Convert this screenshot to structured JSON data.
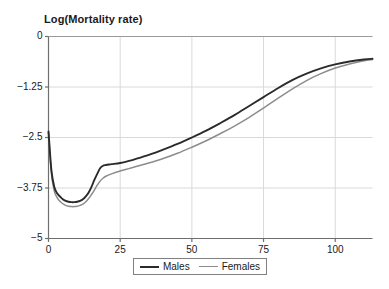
{
  "chart_data": {
    "type": "line",
    "title": "Log(Mortality rate)",
    "xlabel": "",
    "ylabel": "Log(Mortality rate)",
    "xlim": [
      0,
      113
    ],
    "ylim": [
      -5,
      0
    ],
    "grid": true,
    "legend_position": "bottom-center",
    "xticks": [
      0,
      25,
      50,
      75,
      100
    ],
    "xtick_labels": [
      "0",
      "25",
      "50",
      "75",
      "100"
    ],
    "yticks": [
      0,
      -1.25,
      -2.5,
      -3.75,
      -5
    ],
    "ytick_labels": [
      "0",
      "−1.25",
      "−2.5",
      "−3.75",
      "−5"
    ],
    "x": [
      0,
      1,
      2,
      3,
      4,
      5,
      6,
      7,
      8,
      9,
      10,
      11,
      12,
      13,
      14,
      15,
      16,
      17,
      18,
      19,
      20,
      22,
      25,
      28,
      30,
      35,
      40,
      45,
      50,
      55,
      60,
      65,
      70,
      75,
      80,
      85,
      90,
      95,
      100,
      105,
      110,
      113
    ],
    "series": [
      {
        "name": "Males",
        "color": "#2b2b2b",
        "line_width": 1.9,
        "values": [
          -2.35,
          -3.3,
          -3.72,
          -3.88,
          -3.96,
          -4.03,
          -4.07,
          -4.09,
          -4.1,
          -4.1,
          -4.09,
          -4.07,
          -4.03,
          -3.96,
          -3.86,
          -3.72,
          -3.55,
          -3.4,
          -3.26,
          -3.2,
          -3.18,
          -3.16,
          -3.13,
          -3.08,
          -3.04,
          -2.93,
          -2.8,
          -2.66,
          -2.5,
          -2.33,
          -2.14,
          -1.94,
          -1.72,
          -1.5,
          -1.28,
          -1.08,
          -0.92,
          -0.79,
          -0.69,
          -0.62,
          -0.57,
          -0.55
        ]
      },
      {
        "name": "Females",
        "color": "#8c8c8c",
        "line_width": 1.5,
        "values": [
          -2.38,
          -3.38,
          -3.82,
          -3.99,
          -4.08,
          -4.14,
          -4.18,
          -4.2,
          -4.21,
          -4.21,
          -4.2,
          -4.18,
          -4.15,
          -4.09,
          -4.01,
          -3.91,
          -3.8,
          -3.68,
          -3.58,
          -3.51,
          -3.46,
          -3.4,
          -3.33,
          -3.27,
          -3.23,
          -3.13,
          -3.02,
          -2.89,
          -2.74,
          -2.58,
          -2.4,
          -2.21,
          -2.0,
          -1.77,
          -1.53,
          -1.3,
          -1.09,
          -0.92,
          -0.78,
          -0.68,
          -0.6,
          -0.57
        ]
      }
    ]
  },
  "legend": {
    "entries": [
      {
        "label": "Males"
      },
      {
        "label": "Females"
      }
    ]
  },
  "axes": {
    "frame_color": "#808080",
    "grid_color": "#d9d9d9"
  }
}
